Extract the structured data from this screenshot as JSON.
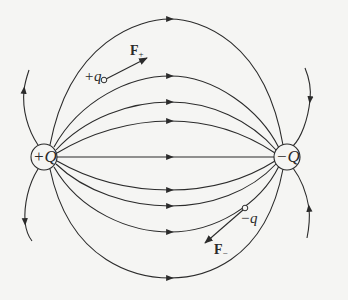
{
  "diagram": {
    "colors": {
      "line": "#2b2b2b",
      "background": "#f5f5f3"
    },
    "charges": [
      {
        "id": "positive-source",
        "label": "+Q",
        "cx": 44,
        "cy": 157,
        "r": 13
      },
      {
        "id": "negative-sink",
        "label": "-Q",
        "cx": 287,
        "cy": 157,
        "r": 13
      }
    ],
    "test_charges": [
      {
        "id": "positive-test",
        "label": "+q",
        "cx": 104,
        "cy": 80,
        "force_label": "F",
        "force_sub": "+",
        "force_to": [
          147,
          58
        ]
      },
      {
        "id": "negative-test",
        "label": "-q",
        "cx": 245,
        "cy": 208,
        "force_label": "F",
        "force_sub": "−",
        "force_to": [
          205,
          243
        ]
      }
    ],
    "field_line_apex_y": [
      19,
      76,
      102,
      121,
      157,
      190,
      206,
      232,
      278
    ]
  },
  "labels": {
    "plus_Q": "+Q",
    "minus_Q": "−Q",
    "plus_q": "+q",
    "minus_q": "−q",
    "F": "F",
    "F_plus_sub": "+",
    "F_minus_sub": "−"
  }
}
